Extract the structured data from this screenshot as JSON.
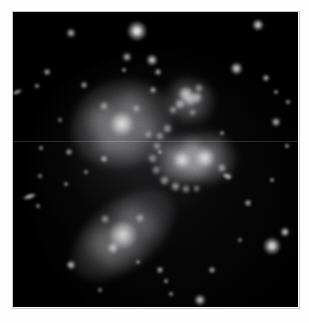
{
  "image": {
    "title": "Stephan's Quintet compact galaxy group",
    "type": "astronomical-optical-image",
    "palette": "grayscale",
    "background_color": "#000000",
    "border_color": "#ffffff",
    "frame": {
      "x": 13,
      "y": 12,
      "width": 285,
      "height": 295
    },
    "canvas": {
      "width": 309,
      "height": 323
    },
    "alt_text": "Monochrome deep-sky photograph showing a tight group of interacting galaxies against a black star field."
  },
  "galaxies": [
    {
      "name": "upper-left-spiral",
      "label": "NGC 7320",
      "cx": 122,
      "cy": 124,
      "halo_rx": 52,
      "halo_ry": 44,
      "rotation": -18,
      "core_radius": 11,
      "core_brightness": "#d8d8d8",
      "halo_brightness": "#6a6a6c"
    },
    {
      "name": "central-pair-west",
      "label": "NGC 7318A",
      "cx": 182,
      "cy": 160,
      "halo_rx": 30,
      "halo_ry": 26,
      "rotation": 0,
      "core_radius": 8,
      "core_brightness": "#cfcfcf",
      "halo_brightness": "#5e5e60"
    },
    {
      "name": "central-pair-east",
      "label": "NGC 7318B",
      "cx": 205,
      "cy": 158,
      "halo_rx": 32,
      "halo_ry": 27,
      "rotation": 0,
      "core_radius": 9,
      "core_brightness": "#d4d4d4",
      "halo_brightness": "#616163"
    },
    {
      "name": "lower-left-elongated",
      "label": "NGC 7317",
      "cx": 123,
      "cy": 235,
      "halo_rx": 60,
      "halo_ry": 34,
      "rotation": -38,
      "core_radius": 13,
      "core_brightness": "#c4c4c4",
      "halo_brightness": "#5c5c5e"
    },
    {
      "name": "upper-right-clumpy",
      "label": "NGC 7319 tidal region",
      "cx": 190,
      "cy": 100,
      "halo_rx": 26,
      "halo_ry": 24,
      "rotation": 20,
      "core_radius": 6,
      "core_brightness": "#b4b4b4",
      "halo_brightness": "#4a4a4c"
    }
  ],
  "knots": [
    {
      "name": "knot-ur-1",
      "cx": 186,
      "cy": 94,
      "r": 7,
      "brightness": "#c8c8c8"
    },
    {
      "name": "knot-ur-2",
      "cx": 196,
      "cy": 97,
      "r": 5.5,
      "brightness": "#b0b0b0"
    },
    {
      "name": "knot-ur-3",
      "cx": 180,
      "cy": 104,
      "r": 5,
      "brightness": "#a8a8a8"
    },
    {
      "name": "knot-ur-4",
      "cx": 199,
      "cy": 88,
      "r": 4,
      "brightness": "#9a9a9a"
    },
    {
      "name": "knot-ur-5",
      "cx": 173,
      "cy": 110,
      "r": 4,
      "brightness": "#8e8e8e"
    },
    {
      "name": "knot-ur-6",
      "cx": 192,
      "cy": 112,
      "r": 3.5,
      "brightness": "#888888"
    },
    {
      "name": "knot-bridge-1",
      "cx": 167,
      "cy": 128,
      "r": 4.5,
      "brightness": "#969696"
    },
    {
      "name": "knot-bridge-2",
      "cx": 160,
      "cy": 136,
      "r": 4,
      "brightness": "#8a8a8a"
    },
    {
      "name": "knot-bridge-3",
      "cx": 157,
      "cy": 146,
      "r": 4,
      "brightness": "#868686"
    },
    {
      "name": "knot-bridge-4",
      "cx": 152,
      "cy": 158,
      "r": 4.5,
      "brightness": "#8e8e8e"
    },
    {
      "name": "knot-bridge-5",
      "cx": 156,
      "cy": 170,
      "r": 4,
      "brightness": "#8a8a8a"
    },
    {
      "name": "knot-bridge-6",
      "cx": 164,
      "cy": 180,
      "r": 4.5,
      "brightness": "#9e9e9e"
    },
    {
      "name": "knot-bridge-7",
      "cx": 175,
      "cy": 186,
      "r": 4.5,
      "brightness": "#a6a6a6"
    },
    {
      "name": "knot-bridge-8",
      "cx": 186,
      "cy": 189,
      "r": 4,
      "brightness": "#9c9c9c"
    },
    {
      "name": "knot-bridge-9",
      "cx": 196,
      "cy": 188,
      "r": 3.5,
      "brightness": "#909090"
    },
    {
      "name": "knot-east-tail-1",
      "cx": 222,
      "cy": 168,
      "r": 4,
      "brightness": "#a0a0a0"
    },
    {
      "name": "knot-east-tail-2",
      "cx": 228,
      "cy": 176,
      "r": 3.5,
      "brightness": "#949494"
    },
    {
      "name": "knot-sw-arm-1",
      "cx": 105,
      "cy": 219,
      "r": 4,
      "brightness": "#9a9a9a"
    },
    {
      "name": "knot-sw-arm-2",
      "cx": 113,
      "cy": 248,
      "r": 5,
      "brightness": "#b8b8b8"
    },
    {
      "name": "knot-sw-arm-3",
      "cx": 140,
      "cy": 218,
      "r": 4,
      "brightness": "#8e8e8e"
    },
    {
      "name": "knot-ul-arm-1",
      "cx": 104,
      "cy": 106,
      "r": 4,
      "brightness": "#909090"
    },
    {
      "name": "knot-ul-arm-2",
      "cx": 136,
      "cy": 108,
      "r": 3.5,
      "brightness": "#888888"
    },
    {
      "name": "knot-ul-arm-3",
      "cx": 148,
      "cy": 134,
      "r": 3.5,
      "brightness": "#848484"
    }
  ],
  "stars": [
    {
      "name": "star-top-bright",
      "cx": 137,
      "cy": 31,
      "r": 7.5,
      "brightness": "#e8e8e8"
    },
    {
      "name": "star-top-right",
      "cx": 258,
      "cy": 25,
      "r": 4.5,
      "brightness": "#c8c8c8"
    },
    {
      "name": "star-top-left",
      "cx": 71,
      "cy": 33,
      "r": 3.5,
      "brightness": "#a8a8a8"
    },
    {
      "name": "star-upper-mid-1",
      "cx": 127,
      "cy": 57,
      "r": 3.5,
      "brightness": "#a0a0a0"
    },
    {
      "name": "star-upper-mid-2",
      "cx": 152,
      "cy": 60,
      "r": 4.5,
      "brightness": "#bcbcbc"
    },
    {
      "name": "star-upper-mid-3",
      "cx": 158,
      "cy": 72,
      "r": 3,
      "brightness": "#989898"
    },
    {
      "name": "star-upper-mid-4",
      "cx": 153,
      "cy": 90,
      "r": 3,
      "brightness": "#8e8e8e"
    },
    {
      "name": "star-upper-mid-5",
      "cx": 124,
      "cy": 70,
      "r": 2.5,
      "brightness": "#868686"
    },
    {
      "name": "star-upper-right-1",
      "cx": 236,
      "cy": 68,
      "r": 5,
      "brightness": "#c4c4c4"
    },
    {
      "name": "star-upper-right-2",
      "cx": 266,
      "cy": 78,
      "r": 3,
      "brightness": "#a2a2a2"
    },
    {
      "name": "star-upper-right-3",
      "cx": 276,
      "cy": 92,
      "r": 2.5,
      "brightness": "#8a8a8a"
    },
    {
      "name": "star-right-1",
      "cx": 276,
      "cy": 122,
      "r": 3.5,
      "brightness": "#a8a8a8"
    },
    {
      "name": "star-right-2",
      "cx": 288,
      "cy": 102,
      "r": 2.5,
      "brightness": "#909090"
    },
    {
      "name": "star-right-3",
      "cx": 287,
      "cy": 146,
      "r": 2.5,
      "brightness": "#8c8c8c"
    },
    {
      "name": "star-right-4",
      "cx": 272,
      "cy": 180,
      "r": 2.5,
      "brightness": "#8a8a8a"
    },
    {
      "name": "star-right-5",
      "cx": 248,
      "cy": 203,
      "r": 3,
      "brightness": "#9c9c9c"
    },
    {
      "name": "star-left-1",
      "cx": 47,
      "cy": 72,
      "r": 3,
      "brightness": "#9a9a9a"
    },
    {
      "name": "star-left-2",
      "cx": 37,
      "cy": 86,
      "r": 2.5,
      "brightness": "#8a8a8a"
    },
    {
      "name": "star-left-3",
      "cx": 84,
      "cy": 85,
      "r": 3,
      "brightness": "#949494"
    },
    {
      "name": "star-left-4",
      "cx": 41,
      "cy": 148,
      "r": 2.5,
      "brightness": "#868686"
    },
    {
      "name": "star-left-5",
      "cx": 69,
      "cy": 152,
      "r": 3,
      "brightness": "#929292"
    },
    {
      "name": "star-left-6",
      "cx": 40,
      "cy": 176,
      "r": 2,
      "brightness": "#7e7e7e"
    },
    {
      "name": "star-left-7",
      "cx": 66,
      "cy": 184,
      "r": 2.5,
      "brightness": "#848484"
    },
    {
      "name": "star-left-8",
      "cx": 38,
      "cy": 206,
      "r": 2,
      "brightness": "#7c7c7c"
    },
    {
      "name": "star-left-9",
      "cx": 86,
      "cy": 172,
      "r": 2,
      "brightness": "#7a7a7a"
    },
    {
      "name": "star-mid-1",
      "cx": 104,
      "cy": 159,
      "r": 3,
      "brightness": "#949494"
    },
    {
      "name": "star-mid-2",
      "cx": 160,
      "cy": 152,
      "r": 2.5,
      "brightness": "#868686"
    },
    {
      "name": "star-mid-3",
      "cx": 222,
      "cy": 133,
      "r": 2.5,
      "brightness": "#888888"
    },
    {
      "name": "star-bottom-1",
      "cx": 71,
      "cy": 265,
      "r": 4,
      "brightness": "#b0b0b0"
    },
    {
      "name": "star-bottom-2",
      "cx": 160,
      "cy": 270,
      "r": 3,
      "brightness": "#9a9a9a"
    },
    {
      "name": "star-bottom-3",
      "cx": 166,
      "cy": 281,
      "r": 2.5,
      "brightness": "#8c8c8c"
    },
    {
      "name": "star-bottom-4",
      "cx": 171,
      "cy": 294,
      "r": 2.5,
      "brightness": "#868686"
    },
    {
      "name": "star-bottom-5",
      "cx": 200,
      "cy": 300,
      "r": 4.5,
      "brightness": "#b4b4b4"
    },
    {
      "name": "star-bottom-6",
      "cx": 212,
      "cy": 270,
      "r": 3,
      "brightness": "#969696"
    },
    {
      "name": "star-bottom-7",
      "cx": 100,
      "cy": 290,
      "r": 2,
      "brightness": "#7c7c7c"
    },
    {
      "name": "star-bottom-8",
      "cx": 138,
      "cy": 262,
      "r": 2,
      "brightness": "#7e7e7e"
    },
    {
      "name": "star-lowerright-big",
      "cx": 272,
      "cy": 246,
      "r": 7,
      "brightness": "#d8d8d8"
    },
    {
      "name": "star-lowerright-small",
      "cx": 285,
      "cy": 232,
      "r": 4,
      "brightness": "#bcbcbc"
    },
    {
      "name": "star-upperleft-faint",
      "cx": 60,
      "cy": 120,
      "r": 2,
      "brightness": "#747474"
    },
    {
      "name": "star-center-faint",
      "cx": 240,
      "cy": 240,
      "r": 2,
      "brightness": "#767676"
    }
  ],
  "streaks": [
    {
      "name": "streak-left-edge",
      "cx": 17,
      "cy": 92,
      "w": 10,
      "h": 4,
      "rotation": -20,
      "brightness": "#bdbdbd"
    },
    {
      "name": "streak-left-lower",
      "cx": 29,
      "cy": 196,
      "w": 13,
      "h": 5,
      "rotation": -18,
      "brightness": "#c6c6c6"
    },
    {
      "name": "streak-right-lower",
      "cx": 226,
      "cy": 176,
      "w": 9,
      "h": 4,
      "rotation": 25,
      "brightness": "#a8a8a8"
    }
  ],
  "artifacts": {
    "scanline": {
      "name": "horizontal-scan-artifact",
      "y": 141,
      "note": "faint horizontal readout line across frame"
    }
  }
}
